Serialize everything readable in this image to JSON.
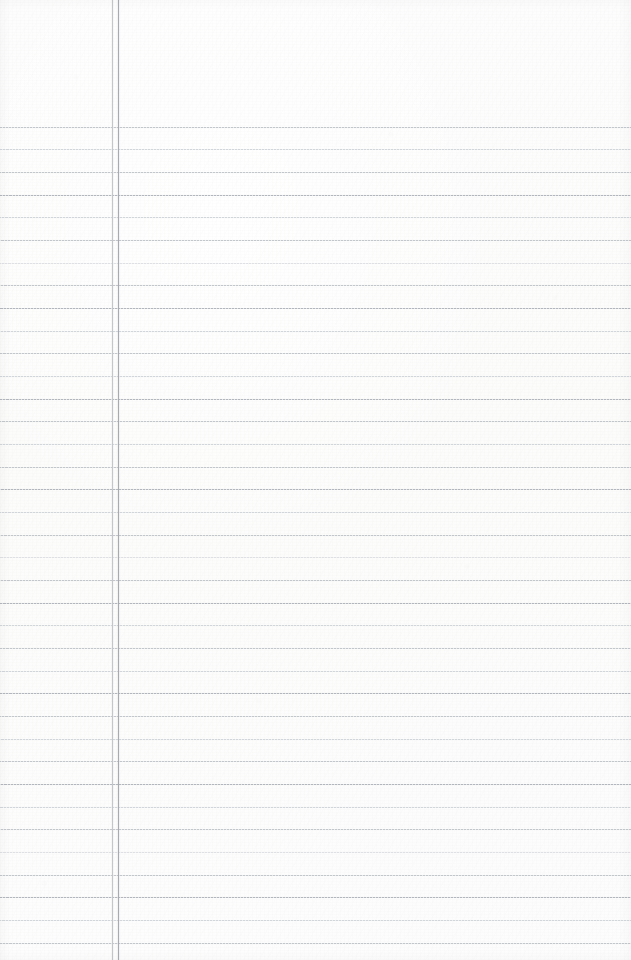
{
  "document": {
    "type": "lined-notebook-paper-scan",
    "content_text": "",
    "page_width": 631,
    "page_height": 960,
    "background_color": "#fdfdfd",
    "orientation": "portrait"
  },
  "header_zone": {
    "label": "",
    "top": 0,
    "height": 127,
    "is_blank": true
  },
  "writing_area": {
    "label": "",
    "is_blank": true,
    "left": 119,
    "top": 127
  },
  "ruling": {
    "style": "wide-ruled",
    "first_line_y": 127,
    "line_pitch": 22.7,
    "line_count": 37,
    "line_extends_full_width": true,
    "colors": {
      "strong": "#b3b6bc",
      "medium": "#c3c6cb",
      "light": "#d2d5da",
      "faint": "#dee0e4"
    },
    "lines": [
      {
        "y": 127,
        "weight": "medium"
      },
      {
        "y": 149,
        "weight": "light"
      },
      {
        "y": 172,
        "weight": "medium"
      },
      {
        "y": 195,
        "weight": "strong"
      },
      {
        "y": 217,
        "weight": "light"
      },
      {
        "y": 240,
        "weight": "medium"
      },
      {
        "y": 263,
        "weight": "faint"
      },
      {
        "y": 285,
        "weight": "medium"
      },
      {
        "y": 308,
        "weight": "strong"
      },
      {
        "y": 331,
        "weight": "light"
      },
      {
        "y": 353,
        "weight": "medium"
      },
      {
        "y": 376,
        "weight": "light"
      },
      {
        "y": 399,
        "weight": "strong"
      },
      {
        "y": 421,
        "weight": "medium"
      },
      {
        "y": 444,
        "weight": "light"
      },
      {
        "y": 467,
        "weight": "medium"
      },
      {
        "y": 489,
        "weight": "strong"
      },
      {
        "y": 512,
        "weight": "light"
      },
      {
        "y": 535,
        "weight": "medium"
      },
      {
        "y": 557,
        "weight": "faint"
      },
      {
        "y": 580,
        "weight": "medium"
      },
      {
        "y": 603,
        "weight": "strong"
      },
      {
        "y": 625,
        "weight": "light"
      },
      {
        "y": 648,
        "weight": "medium"
      },
      {
        "y": 671,
        "weight": "light"
      },
      {
        "y": 693,
        "weight": "strong"
      },
      {
        "y": 716,
        "weight": "medium"
      },
      {
        "y": 739,
        "weight": "light"
      },
      {
        "y": 761,
        "weight": "medium"
      },
      {
        "y": 784,
        "weight": "strong"
      },
      {
        "y": 807,
        "weight": "light"
      },
      {
        "y": 829,
        "weight": "medium"
      },
      {
        "y": 852,
        "weight": "faint"
      },
      {
        "y": 875,
        "weight": "medium"
      },
      {
        "y": 897,
        "weight": "strong"
      },
      {
        "y": 920,
        "weight": "light"
      },
      {
        "y": 943,
        "weight": "medium"
      }
    ]
  },
  "margin_rules": {
    "count": 2,
    "inner": {
      "x": 112,
      "color": "#c4c7cc",
      "weight": "light"
    },
    "outer": {
      "x": 118,
      "color": "#a8abb1",
      "weight": "strong"
    }
  }
}
